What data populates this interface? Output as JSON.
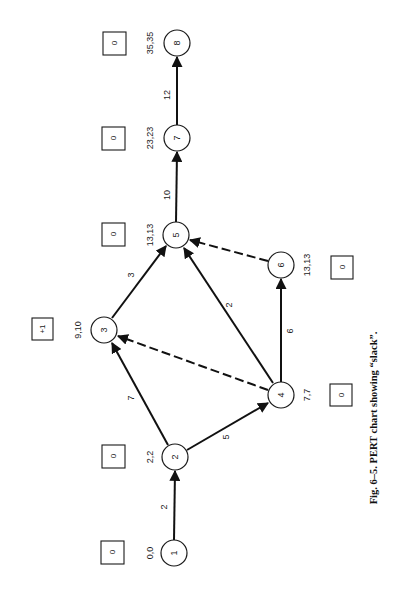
{
  "figure": {
    "caption": "Fig. 6–5.  PERT chart showing “slack”.",
    "orientation": "rotated 90deg counterclockwise",
    "colors": {
      "ink": "#111111",
      "background": "#ffffff"
    }
  },
  "nodes": [
    {
      "id": "1",
      "label": "1",
      "times": "0,0",
      "slack": "0",
      "cx": 174,
      "cy": 553
    },
    {
      "id": "2",
      "label": "2",
      "times": "2,2",
      "slack": "0",
      "cx": 175,
      "cy": 457
    },
    {
      "id": "3",
      "label": "3",
      "times": "9,10",
      "slack": "+1",
      "cx": 104,
      "cy": 330
    },
    {
      "id": "4",
      "label": "4",
      "times": "7,7",
      "slack": "0",
      "cx": 281,
      "cy": 395
    },
    {
      "id": "5",
      "label": "5",
      "times": "13,13",
      "slack": "0",
      "cx": 176,
      "cy": 235
    },
    {
      "id": "6",
      "label": "6",
      "times": "13,13",
      "slack": "0",
      "cx": 281,
      "cy": 265
    },
    {
      "id": "7",
      "label": "7",
      "times": "23,23",
      "slack": "0",
      "cx": 177,
      "cy": 138
    },
    {
      "id": "8",
      "label": "8",
      "times": "35,35",
      "slack": "0",
      "cx": 177,
      "cy": 43
    }
  ],
  "edges": [
    {
      "from": "1",
      "to": "2",
      "duration": "2",
      "style": "solid"
    },
    {
      "from": "2",
      "to": "3",
      "duration": "7",
      "style": "solid"
    },
    {
      "from": "2",
      "to": "4",
      "duration": "5",
      "style": "solid"
    },
    {
      "from": "4",
      "to": "3",
      "duration": "",
      "style": "dashed"
    },
    {
      "from": "3",
      "to": "5",
      "duration": "3",
      "style": "solid"
    },
    {
      "from": "4",
      "to": "5",
      "duration": "2",
      "style": "solid"
    },
    {
      "from": "4",
      "to": "6",
      "duration": "6",
      "style": "solid"
    },
    {
      "from": "6",
      "to": "5",
      "duration": "",
      "style": "dashed"
    },
    {
      "from": "5",
      "to": "7",
      "duration": "10",
      "style": "solid"
    },
    {
      "from": "7",
      "to": "8",
      "duration": "12",
      "style": "solid"
    }
  ]
}
